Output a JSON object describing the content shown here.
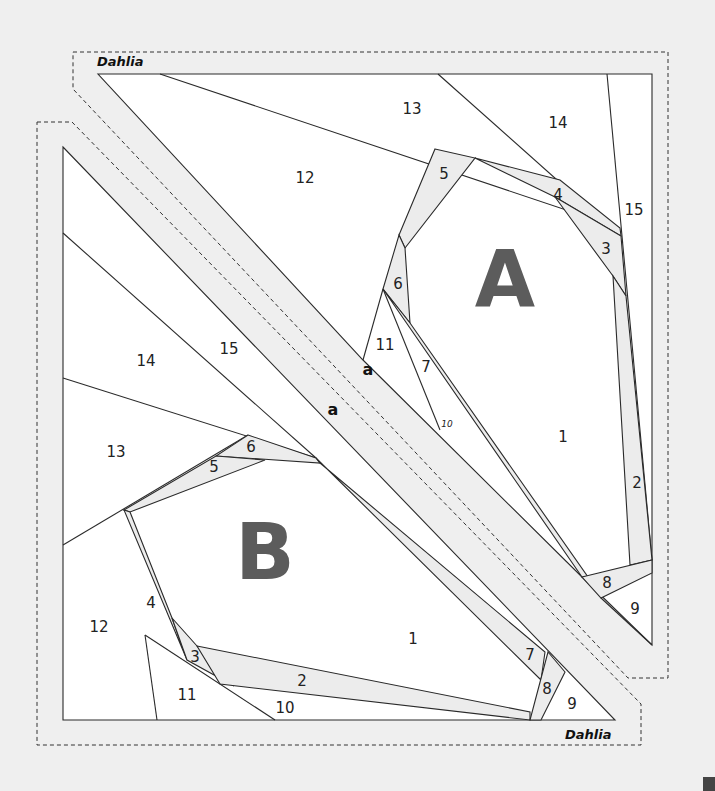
{
  "pattern": {
    "name": "Dahlia",
    "section_a": {
      "label": "A",
      "title": "Dahlia",
      "pieces": [
        "1",
        "2",
        "3",
        "4",
        "5",
        "6",
        "7",
        "8",
        "9",
        "10",
        "11",
        "12",
        "13",
        "14",
        "15"
      ],
      "join_mark": "a"
    },
    "section_b": {
      "label": "B",
      "title": "Dahlia",
      "pieces": [
        "1",
        "2",
        "3",
        "4",
        "5",
        "6",
        "7",
        "8",
        "9",
        "10",
        "11",
        "12",
        "13",
        "14",
        "15"
      ],
      "join_mark": "a"
    }
  },
  "colors": {
    "background": "#efefef",
    "piece_fill": "#ffffff",
    "shaded_fill": "#ececec",
    "line": "#2a2a2a",
    "letter": "#5c5c5c"
  }
}
